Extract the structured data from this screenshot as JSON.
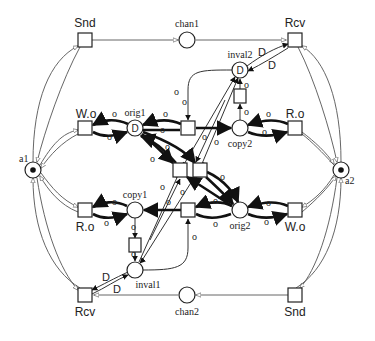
{
  "diagram": {
    "type": "petri-net",
    "colors": {
      "stroke": "#222222",
      "background": "#ffffff"
    },
    "places": {
      "chan1": "chan1",
      "chan2": "chan2",
      "inval1": "inval1",
      "inval2": "inval2",
      "orig1": "orig1",
      "orig2": "orig2",
      "copy1": "copy1",
      "copy2": "copy2",
      "a1": "a1",
      "a2": "a2"
    },
    "place_tokens": {
      "orig1": "D",
      "inval2": "D"
    },
    "transitions": {
      "snd_top": "Snd",
      "rcv_top": "Rcv",
      "wo_left": "W.o",
      "ro_left": "R.o",
      "ro_right": "R.o",
      "wo_right": "W.o",
      "rcv_bottom": "Rcv",
      "snd_bottom": "Snd"
    },
    "arc_labels": {
      "o": "o",
      "D": "D"
    }
  }
}
